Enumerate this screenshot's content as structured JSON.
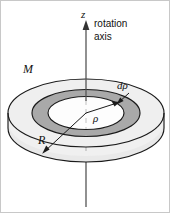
{
  "figure": {
    "background_color": "#ffffff",
    "border_color": "#c8c8c8",
    "line_color": "#1a1a1a",
    "axis": {
      "symbol": "z",
      "caption_line1": "rotation",
      "caption_line2": "axis",
      "arrow_name": "up-arrow",
      "x": 85,
      "top_y": 22,
      "bottom_y": 206
    },
    "disk": {
      "name": "solid-disk",
      "mass_label": "M",
      "radius_label": "R",
      "center_x": 85,
      "center_y": 112,
      "outer_rx": 78,
      "outer_ry": 34,
      "thickness": 15,
      "top_face_color": "#f0f0f0",
      "side_wall_color": "#e4e4e4",
      "inner_face_color": "#fcfcfc"
    },
    "annulus": {
      "name": "mass-element-annulus",
      "thickness_label": "dρ",
      "radius_label": "ρ",
      "inner_rx": 38,
      "inner_ry": 16.5,
      "outer_rx": 54,
      "outer_ry": 23.5,
      "fill_color": "#a9a9a9"
    },
    "labels": [
      {
        "id": "z-label",
        "text": "z",
        "style": "math",
        "x": 80,
        "y": 17,
        "size": 11
      },
      {
        "id": "rotation-label",
        "text": "rotation",
        "style": "sans",
        "x": 93,
        "y": 26,
        "size": 10
      },
      {
        "id": "axis-label",
        "text": "axis",
        "style": "sans",
        "x": 93,
        "y": 39,
        "size": 10
      },
      {
        "id": "mass-label",
        "text": "M",
        "style": "math",
        "x": 22,
        "y": 72,
        "size": 12
      },
      {
        "id": "drho-label",
        "text": "dρ",
        "style": "math",
        "x": 117,
        "y": 88,
        "size": 11
      },
      {
        "id": "rho-label",
        "text": "ρ",
        "style": "math",
        "x": 92,
        "y": 121,
        "size": 11
      },
      {
        "id": "R-label",
        "text": "R",
        "style": "math",
        "x": 38,
        "y": 143,
        "size": 12
      }
    ]
  }
}
